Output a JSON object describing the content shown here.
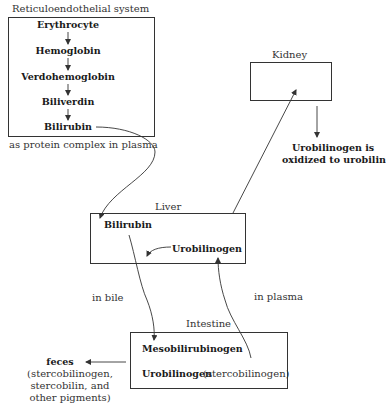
{
  "diagram": {
    "res": {
      "title": "Reticuloendothelial system",
      "steps": [
        "Erythrocyte",
        "Hemoglobin",
        "Verdohemoglobin",
        "Biliverdin",
        "Bilirubin"
      ],
      "transport_label": "as protein complex in plasma"
    },
    "kidney": {
      "title": "Kidney",
      "note_line1": "Urobilinogen is",
      "note_line2": "oxidized to urobilin"
    },
    "liver": {
      "title": "Liver",
      "bilirubin": "Bilirubin",
      "urobilinogen": "Urobilinogen"
    },
    "paths": {
      "bile_label": "in bile",
      "plasma_label": "in plasma"
    },
    "intestine": {
      "title": "Intestine",
      "mesobilirubinogen": "Mesobilirubinogen",
      "urobilinogen": "Urobilinogen",
      "urobilinogen_note": "(stercobilinogen)"
    },
    "feces": {
      "title": "feces",
      "line1": "(stercobilinogen,",
      "line2": "stercobilin, and",
      "line3": "other pigments)"
    }
  }
}
